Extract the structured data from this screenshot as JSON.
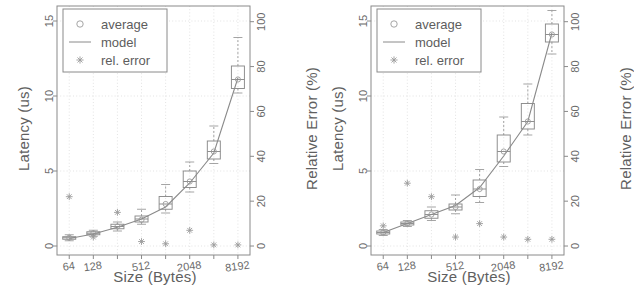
{
  "figure": {
    "panel_count": 2,
    "style": "grayscale scanned figure, two box-plot charts side by side"
  },
  "legend": {
    "items": [
      {
        "label": "average",
        "marker": "circle-marker-icon"
      },
      {
        "label": "model",
        "marker": "line-marker-icon"
      },
      {
        "label": "rel. error",
        "marker": "star-marker-icon"
      }
    ]
  },
  "axes_common": {
    "xlabel": "Size (Bytes)",
    "ylabel_left": "Latency (us)",
    "ylabel_right": "Relative Error (%)",
    "x_ticks_labeled": [
      "64",
      "128",
      "512",
      "2048",
      "8192"
    ],
    "x_ticks_all": [
      64,
      128,
      256,
      512,
      1024,
      2048,
      4096,
      8192
    ],
    "y_left_ticks": [
      "0",
      "5",
      "10",
      "15"
    ],
    "y_right_ticks": [
      "0",
      "20",
      "40",
      "60",
      "80",
      "100"
    ]
  },
  "chart_data": [
    {
      "type": "box",
      "id": "left-chart",
      "title": "",
      "xlabel": "Size (Bytes)",
      "ylabel": "Latency (us)",
      "ylabel_right": "Relative Error (%)",
      "xscale": "log2",
      "xlim": [
        45,
        11600
      ],
      "ylim": [
        -0.6,
        16.0
      ],
      "ylim_right": [
        -4,
        107
      ],
      "grid": true,
      "legend_position": "top-left",
      "x": [
        64,
        128,
        256,
        512,
        1024,
        2048,
        4096,
        8192
      ],
      "xtick_labels": [
        "64",
        "128",
        "",
        "512",
        "",
        "2048",
        "",
        "8192"
      ],
      "series": [
        {
          "name": "average",
          "axis": "left",
          "values": [
            0.55,
            0.85,
            1.3,
            1.75,
            2.8,
            4.3,
            6.3,
            11.1
          ]
        },
        {
          "name": "model",
          "axis": "left",
          "values": [
            0.5,
            0.8,
            1.25,
            1.8,
            2.6,
            4.2,
            6.2,
            11.2
          ]
        },
        {
          "name": "rel. error",
          "axis": "right",
          "values": [
            22.0,
            4.0,
            15.0,
            2.0,
            1.0,
            7.0,
            0.5,
            0.5
          ]
        }
      ],
      "boxes": [
        {
          "x": 64,
          "q1": 0.45,
          "median": 0.55,
          "q3": 0.62,
          "low": 0.35,
          "high": 0.75
        },
        {
          "x": 128,
          "q1": 0.75,
          "median": 0.85,
          "q3": 0.95,
          "low": 0.65,
          "high": 1.05
        },
        {
          "x": 256,
          "q1": 1.15,
          "median": 1.3,
          "q3": 1.45,
          "low": 1.0,
          "high": 1.6
        },
        {
          "x": 512,
          "q1": 1.6,
          "median": 1.8,
          "q3": 2.0,
          "low": 1.45,
          "high": 2.45
        },
        {
          "x": 1024,
          "q1": 2.45,
          "median": 2.8,
          "q3": 3.3,
          "low": 2.2,
          "high": 4.1
        },
        {
          "x": 2048,
          "q1": 3.9,
          "median": 4.3,
          "q3": 5.0,
          "low": 3.6,
          "high": 5.6
        },
        {
          "x": 4096,
          "q1": 5.8,
          "median": 6.3,
          "q3": 7.0,
          "low": 5.5,
          "high": 8.0
        },
        {
          "x": 8192,
          "q1": 10.5,
          "median": 11.1,
          "q3": 12.0,
          "low": 10.2,
          "high": 13.9
        }
      ]
    },
    {
      "type": "box",
      "id": "right-chart",
      "title": "",
      "xlabel": "Size (Bytes)",
      "ylabel": "Latency (us)",
      "ylabel_right": "Relative Error (%)",
      "xscale": "log2",
      "xlim": [
        45,
        11600
      ],
      "ylim": [
        -0.6,
        16.0
      ],
      "ylim_right": [
        -4,
        107
      ],
      "grid": true,
      "legend_position": "top-left",
      "x": [
        64,
        128,
        256,
        512,
        1024,
        2048,
        4096,
        8192
      ],
      "xtick_labels": [
        "64",
        "128",
        "",
        "512",
        "",
        "2048",
        "",
        "8192"
      ],
      "series": [
        {
          "name": "average",
          "axis": "left",
          "values": [
            0.9,
            1.5,
            2.1,
            2.6,
            3.8,
            6.3,
            8.3,
            14.1
          ]
        },
        {
          "name": "model",
          "axis": "left",
          "values": [
            0.9,
            1.5,
            2.1,
            2.7,
            3.9,
            6.0,
            8.3,
            14.2
          ]
        },
        {
          "name": "rel. error",
          "axis": "right",
          "values": [
            9.0,
            28.0,
            22.0,
            4.0,
            10.0,
            4.0,
            3.0,
            3.0
          ]
        }
      ],
      "boxes": [
        {
          "x": 64,
          "q1": 0.8,
          "median": 0.9,
          "q3": 1.0,
          "low": 0.7,
          "high": 1.1
        },
        {
          "x": 128,
          "q1": 1.4,
          "median": 1.5,
          "q3": 1.6,
          "low": 1.3,
          "high": 1.7
        },
        {
          "x": 256,
          "q1": 1.85,
          "median": 2.1,
          "q3": 2.35,
          "low": 1.7,
          "high": 2.6
        },
        {
          "x": 512,
          "q1": 2.4,
          "median": 2.6,
          "q3": 2.8,
          "low": 2.15,
          "high": 3.4
        },
        {
          "x": 1024,
          "q1": 3.3,
          "median": 3.8,
          "q3": 4.4,
          "low": 2.9,
          "high": 5.1
        },
        {
          "x": 2048,
          "q1": 5.6,
          "median": 6.3,
          "q3": 7.4,
          "low": 5.3,
          "high": 8.6
        },
        {
          "x": 4096,
          "q1": 7.8,
          "median": 8.3,
          "q3": 9.5,
          "low": 7.4,
          "high": 10.8
        },
        {
          "x": 8192,
          "q1": 13.6,
          "median": 14.1,
          "q3": 14.8,
          "low": 12.8,
          "high": 15.7
        }
      ]
    }
  ]
}
